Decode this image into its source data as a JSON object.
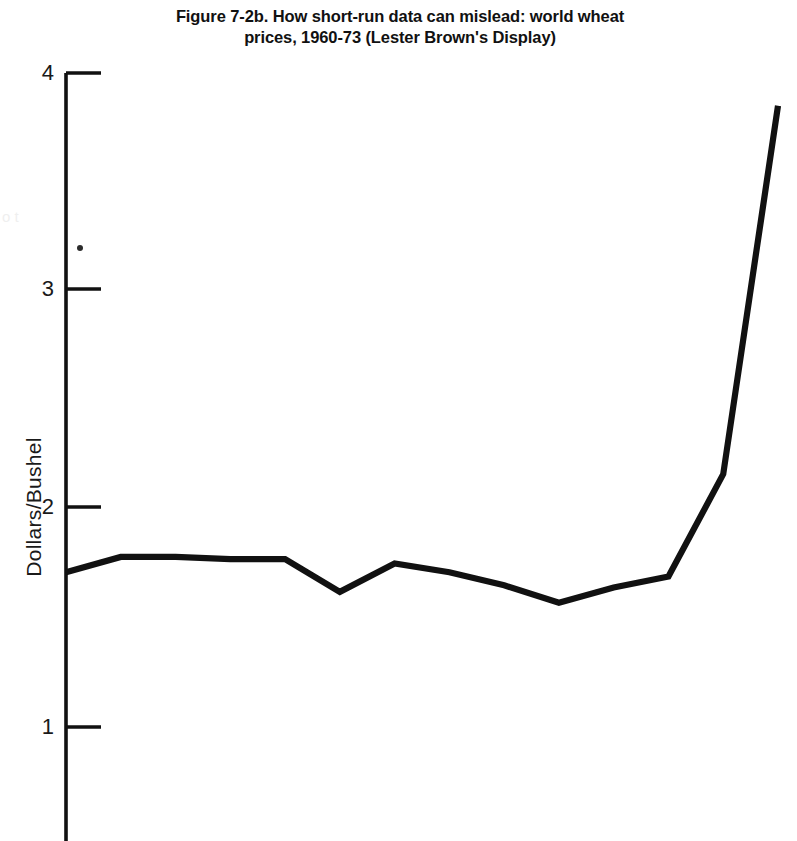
{
  "figure": {
    "title_line_1": "Figure 7-2b. How short-run data can mislead: world wheat",
    "title_line_2": "prices, 1960-73 (Lester Brown's Display)",
    "ink_color": "#111111",
    "background_color": "#ffffff"
  },
  "axes": {
    "y_label": "Dollars/Bushel",
    "y_ticks": [
      "4",
      "3",
      "2",
      "1"
    ],
    "y_tick_values": [
      4,
      3,
      2,
      1
    ]
  },
  "artifacts": {
    "ghost_text": "o t",
    "speck_label": "scan-speck"
  },
  "chart_data": {
    "type": "line",
    "title": "Figure 7-2b. How short-run data can mislead: world wheat prices, 1960-73 (Lester Brown's Display)",
    "xlabel": "",
    "ylabel": "Dollars/Bushel",
    "ylim": [
      0.45,
      4.0
    ],
    "xlim": [
      1960,
      1973
    ],
    "grid": false,
    "legend": "none",
    "y_ticks": [
      1,
      2,
      3,
      4
    ],
    "x_ticks_visible": false,
    "x": [
      1960,
      1961,
      1962,
      1963,
      1964,
      1965,
      1966,
      1967,
      1968,
      1969,
      1970,
      1971,
      1972,
      1973
    ],
    "series": [
      {
        "name": "World wheat price",
        "values": [
          1.71,
          1.78,
          1.78,
          1.77,
          1.77,
          1.62,
          1.75,
          1.71,
          1.65,
          1.57,
          1.64,
          1.69,
          2.16,
          3.85
        ]
      }
    ]
  }
}
